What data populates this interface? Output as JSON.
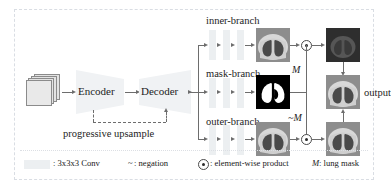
{
  "pipeline": {
    "input_name": "input-volume-stack",
    "encoder_label": "Encoder",
    "decoder_label": "Decoder",
    "progressive_upsample_label": "progressive upsample",
    "output_label": "output"
  },
  "branches": [
    {
      "id": "inner",
      "label": "inner-branch",
      "conv_count": 3,
      "tile": "ct-lung-slice"
    },
    {
      "id": "mask",
      "label": "mask-branch",
      "conv_count": 3,
      "tile": "binary-lung-mask"
    },
    {
      "id": "outer",
      "label": "outer-branch",
      "conv_count": 3,
      "tile": "ct-lung-slice"
    }
  ],
  "annotations": {
    "mask_positive": "M",
    "mask_negated": "~M"
  },
  "operators": {
    "product_symbol": "⊙"
  },
  "legend": {
    "conv_swatch_name": "conv-block-swatch",
    "conv_text": ": 3x3x3 Conv",
    "negation_symbol": "~",
    "negation_text": ": negation",
    "product_text": ": element-wise product",
    "mask_symbol": "M",
    "mask_text": ": lung mask"
  },
  "colors": {
    "conv_block": "#eceff1",
    "line": "#6d6d6d",
    "frame": "#d9dde3",
    "mask_background": "#000000",
    "mask_foreground": "#ffffff",
    "text": "#1d1d1d"
  }
}
